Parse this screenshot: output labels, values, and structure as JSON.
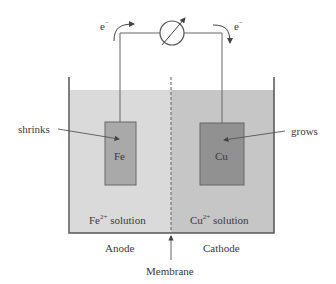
{
  "diagram": {
    "type": "galvanic-cell",
    "circuit": {
      "meter_icon": "galvanometer-icon",
      "electron_left": {
        "label": "e",
        "charge": "−"
      },
      "electron_right": {
        "label": "e",
        "charge": "−"
      }
    },
    "anode": {
      "electrode": "Fe",
      "annotation": "shrinks",
      "solution_ion": "Fe",
      "solution_charge": "2+",
      "solution_word": "solution",
      "label": "Anode"
    },
    "cathode": {
      "electrode": "Cu",
      "annotation": "grows",
      "solution_ion": "Cu",
      "solution_charge": "2+",
      "solution_word": "solution",
      "label": "Cathode"
    },
    "membrane": {
      "label": "Membrane"
    },
    "colors": {
      "left_solution": "#d9d9d9",
      "right_solution": "#c4c4c4",
      "fe_electrode": "#a9a9a9",
      "cu_electrode": "#8f8f8f",
      "line": "#555555"
    }
  }
}
